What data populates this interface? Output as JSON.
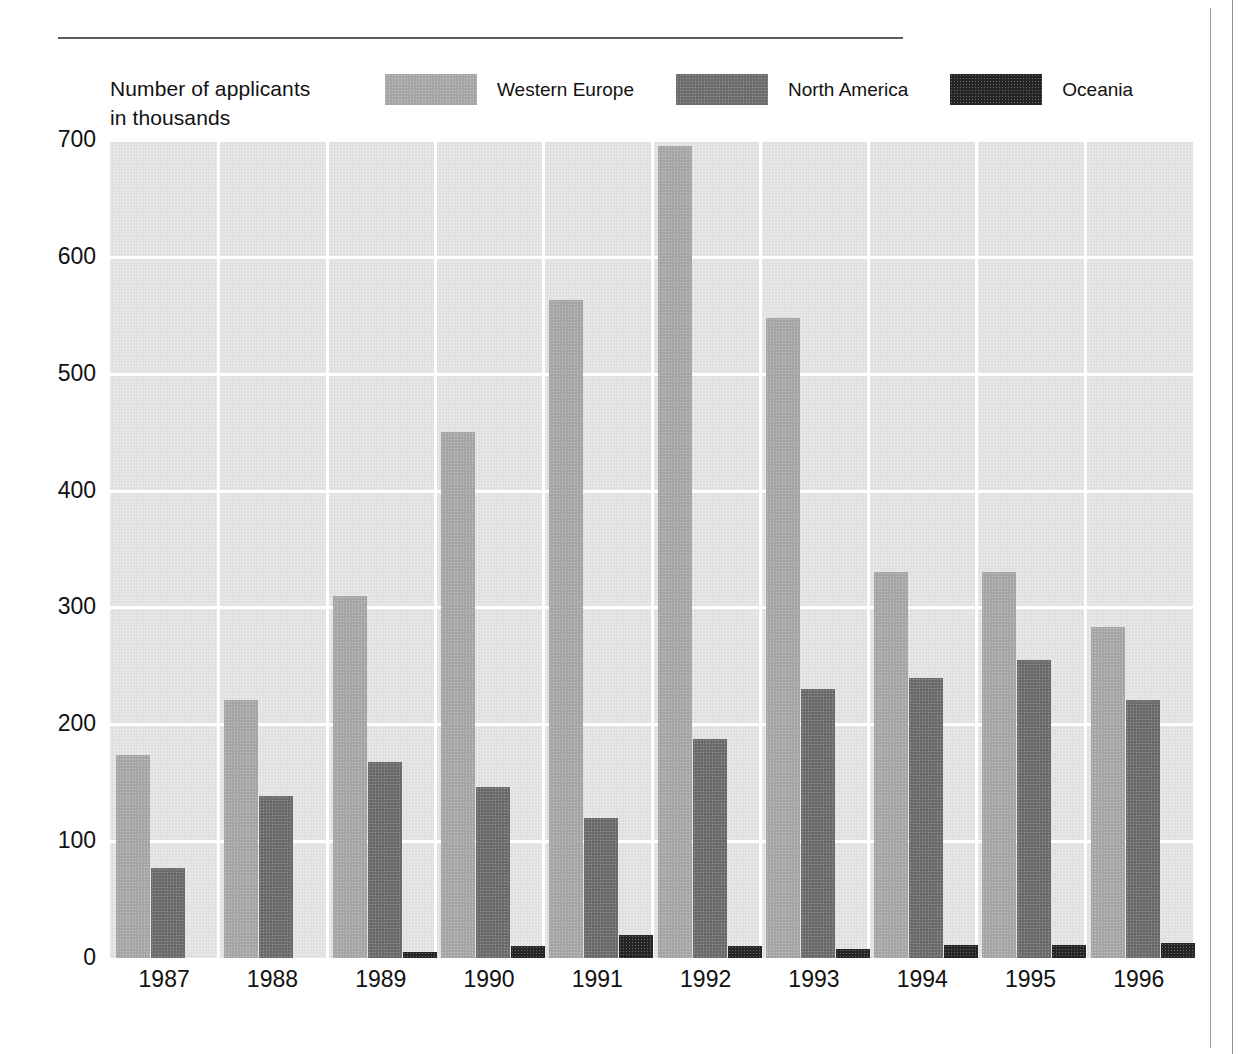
{
  "page": {
    "rule_present": true
  },
  "axis_title": {
    "line1": "Number of applicants",
    "line2": "in thousands"
  },
  "legend": {
    "items": [
      {
        "label": "Western Europe",
        "color": "#a9a9a9",
        "name": "western-europe"
      },
      {
        "label": "North America",
        "color": "#6e6e6e",
        "name": "north-america"
      },
      {
        "label": "Oceania",
        "color": "#262626",
        "name": "oceania"
      }
    ]
  },
  "chart_data": {
    "type": "bar",
    "title": "",
    "subtitle": "",
    "xlabel": "",
    "ylabel": "Number of applicants in thousands",
    "ylim": [
      0,
      700
    ],
    "yticks": [
      0,
      100,
      200,
      300,
      400,
      500,
      600,
      700
    ],
    "ytick_labels": [
      "0",
      "100",
      "200",
      "300",
      "400",
      "500",
      "600",
      "700"
    ],
    "grid": true,
    "grid_color": "#ffffff",
    "plot_background": "#e3e3e3",
    "legend_position": "top",
    "categories": [
      "1987",
      "1988",
      "1989",
      "1990",
      "1991",
      "1992",
      "1993",
      "1994",
      "1995",
      "1996"
    ],
    "series": [
      {
        "name": "Western Europe",
        "color": "#a9a9a9",
        "values": [
          174,
          221,
          310,
          450,
          563,
          695,
          548,
          330,
          330,
          283
        ]
      },
      {
        "name": "North America",
        "color": "#6e6e6e",
        "values": [
          77,
          139,
          168,
          146,
          120,
          187,
          230,
          240,
          255,
          221
        ]
      },
      {
        "name": "Oceania",
        "color": "#262626",
        "values": [
          0,
          0,
          5,
          10,
          20,
          10,
          8,
          11,
          11,
          13
        ]
      }
    ]
  }
}
